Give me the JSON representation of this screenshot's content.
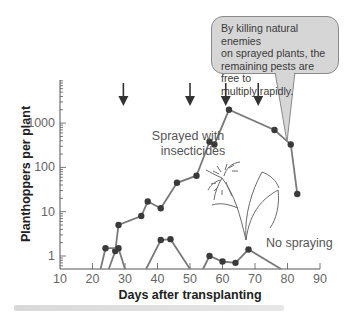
{
  "chart_data": {
    "type": "line",
    "title": "",
    "xlabel": "Days after transplanting",
    "ylabel": "Planthoppers per plant",
    "xlim": [
      10,
      90
    ],
    "xticks": [
      10,
      20,
      30,
      40,
      50,
      60,
      70,
      80,
      90
    ],
    "yscale": "log",
    "ylim": [
      0.5,
      10000
    ],
    "yticks": [
      1,
      10,
      100,
      1000
    ],
    "ytick_labels": [
      "1",
      "10",
      "100",
      "1000"
    ],
    "grid": false,
    "series": [
      {
        "name": "Sprayed with insecticides",
        "label_lines": [
          "Sprayed with",
          "insecticides"
        ],
        "points": [
          {
            "x": 25,
            "y": 0.5,
            "marker": false
          },
          {
            "x": 27,
            "y": 1.3
          },
          {
            "x": 28,
            "y": 5
          },
          {
            "x": 35,
            "y": 8
          },
          {
            "x": 37,
            "y": 17
          },
          {
            "x": 41,
            "y": 12
          },
          {
            "x": 46,
            "y": 45
          },
          {
            "x": 52,
            "y": 65
          },
          {
            "x": 56,
            "y": 380
          },
          {
            "x": 57.5,
            "y": 330
          },
          {
            "x": 62,
            "y": 2000
          },
          {
            "x": 76,
            "y": 700
          },
          {
            "x": 81,
            "y": 330
          },
          {
            "x": 83,
            "y": 25
          }
        ]
      },
      {
        "name": "No spraying",
        "label_lines": [
          "No spraying"
        ],
        "segments": [
          [
            {
              "x": 22.5,
              "y": 0.5,
              "marker": false
            },
            {
              "x": 24,
              "y": 1.5
            },
            {
              "x": 28,
              "y": 1.5
            },
            {
              "x": 30,
              "y": 0.5,
              "marker": false
            }
          ],
          [
            {
              "x": 36.5,
              "y": 0.5,
              "marker": false
            },
            {
              "x": 41,
              "y": 2.3
            },
            {
              "x": 44,
              "y": 2.4
            },
            {
              "x": 50,
              "y": 0.5,
              "marker": false
            }
          ],
          [
            {
              "x": 54,
              "y": 0.5,
              "marker": false
            },
            {
              "x": 56,
              "y": 1.0
            },
            {
              "x": 60,
              "y": 0.75
            },
            {
              "x": 64,
              "y": 0.7
            },
            {
              "x": 68,
              "y": 1.4
            },
            {
              "x": 78,
              "y": 0.5,
              "marker": false
            }
          ]
        ]
      }
    ],
    "annotations": {
      "spray_arrows_days": [
        29.5,
        50,
        61,
        71
      ],
      "callout_text": "By killing natural enemies on sprayed plants, the remaining pests are free to multiply rapidly.",
      "callout_lines": [
        "By killing natural enemies",
        "on sprayed plants, the",
        "remaining pests are free to",
        "multiply rapidly."
      ],
      "illustration": "rice-plant"
    },
    "colors": {
      "line": "#7a7a7a",
      "marker": "#3a3a3a",
      "axis": "#555555",
      "arrow": "#333333",
      "callout_fill": "#d6d6d6"
    }
  }
}
